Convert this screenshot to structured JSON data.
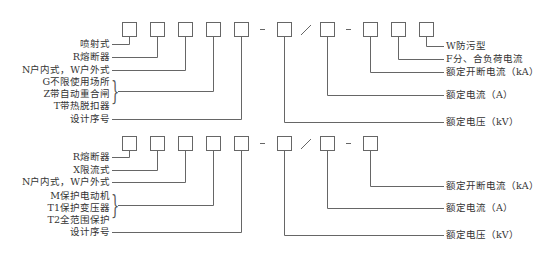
{
  "diagram": {
    "top": {
      "left_labels": [
        "喷射式",
        "R熔断器",
        "N户内式，W户外式"
      ],
      "group_labels": [
        "G不限使用场所",
        "Z带自动重合闸",
        "T带热脱扣器"
      ],
      "serial_label": "设计序号",
      "right_labels": [
        "W防污型",
        "F分、合负荷电流",
        "额定开断电流（kA）",
        "额定电流（A）",
        "额定电压（kV）"
      ]
    },
    "bottom": {
      "left_labels": [
        "R熔断器",
        "X限流式",
        "N户内式，W户外式"
      ],
      "group_labels": [
        "M保护电动机",
        "T1保护变压器",
        "T2全范围保护"
      ],
      "serial_label": "设计序号",
      "right_labels": [
        "额定开断电流（kA）",
        "额定电流（A）",
        "额定电压（kV）"
      ]
    },
    "separators": {
      "dash": "-",
      "slash": "/"
    },
    "colors": {
      "line": "#555555",
      "text": "#333333"
    }
  }
}
